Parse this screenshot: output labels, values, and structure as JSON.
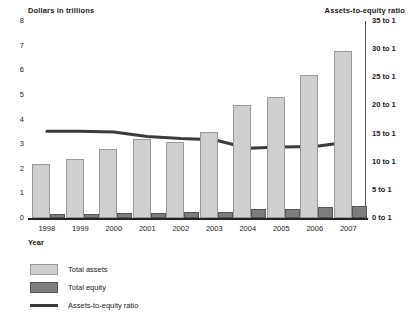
{
  "axes": {
    "left_title": "Dollars in trillions",
    "right_title": "Assets-to-equity ratio",
    "x_label": "Year",
    "left_ticks": [
      "8",
      "7",
      "6",
      "5",
      "4",
      "3",
      "2",
      "1",
      "0"
    ],
    "right_ticks": [
      "35 to 1",
      "30 to 1",
      "25 to 1",
      "20 to 1",
      "15 to 1",
      "10 to 1",
      "5 to 1",
      "0 to 1"
    ]
  },
  "legend": {
    "items": [
      {
        "label": "Total assets",
        "swatch": "light-gray-square",
        "color": "#cfcfcf"
      },
      {
        "label": "Total equity",
        "swatch": "dark-gray-square",
        "color": "#7d7d7d"
      },
      {
        "label": "Assets-to-equity ratio",
        "swatch": "dark-line",
        "color": "#3b3b3b"
      }
    ]
  },
  "chart_data": {
    "type": "bar",
    "title": "",
    "xlabel": "Year",
    "ylabel": "Dollars in trillions",
    "y2label": "Assets-to-equity ratio",
    "categories": [
      "1998",
      "1999",
      "2000",
      "2001",
      "2002",
      "2003",
      "2004",
      "2005",
      "2006",
      "2007"
    ],
    "ylim": [
      0,
      8
    ],
    "y2lim": [
      0,
      35
    ],
    "grid": false,
    "legend_position": "bottom-left",
    "series": [
      {
        "name": "Total assets",
        "type": "bar",
        "axis": "left",
        "color": "#cfcfcf",
        "values": [
          2.2,
          2.4,
          2.8,
          3.2,
          3.1,
          3.5,
          4.6,
          4.9,
          5.8,
          6.8
        ]
      },
      {
        "name": "Total equity",
        "type": "bar",
        "axis": "left",
        "color": "#7d7d7d",
        "values": [
          0.15,
          0.17,
          0.2,
          0.22,
          0.23,
          0.26,
          0.36,
          0.38,
          0.45,
          0.48
        ]
      },
      {
        "name": "Assets-to-equity ratio",
        "type": "line",
        "axis": "right",
        "color": "#3b3b3b",
        "values": [
          15.4,
          15.4,
          15.3,
          14.5,
          14.1,
          13.9,
          12.4,
          12.6,
          12.7,
          13.5
        ]
      }
    ]
  }
}
